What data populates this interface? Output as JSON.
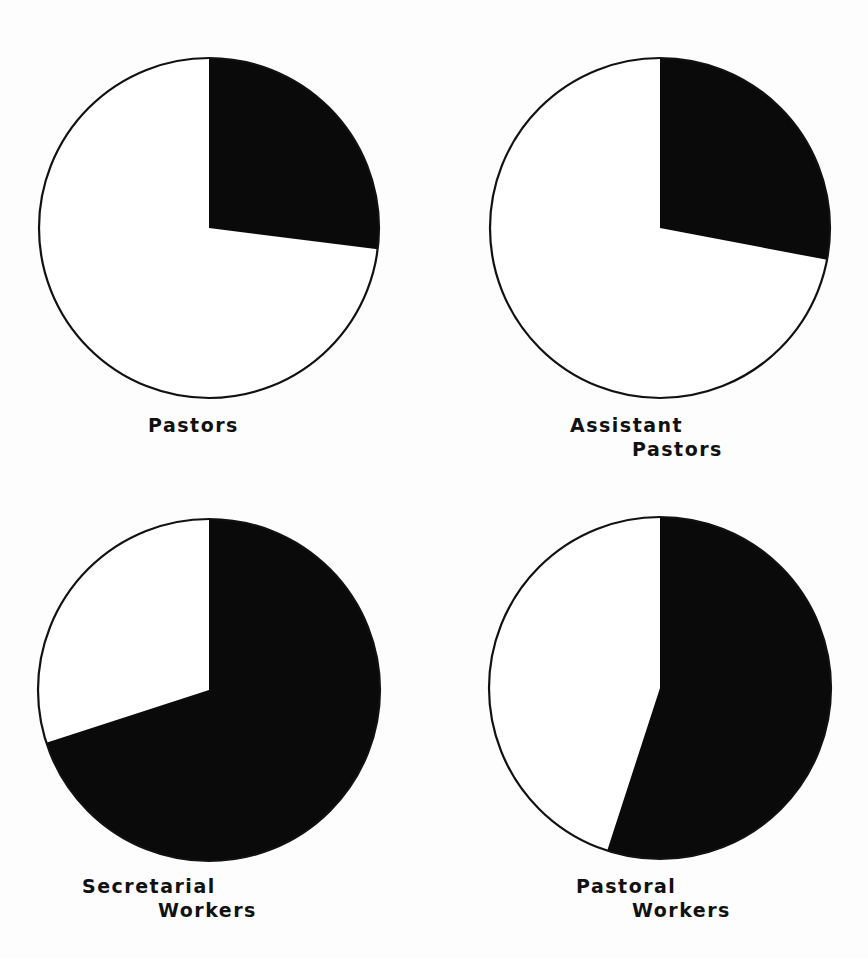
{
  "chart_data": {
    "type": "pie",
    "title": "",
    "colors": {
      "filled": "#0a0a0a",
      "unfilled": "#ffffff",
      "outline": "#111111"
    },
    "charts": [
      {
        "label_lines": [
          "Pastors"
        ],
        "slices": [
          {
            "name": "filled",
            "value": 27
          },
          {
            "name": "unfilled",
            "value": 73
          }
        ],
        "center": [
          209,
          228
        ],
        "radius": 170,
        "label_pos": [
          148,
          413
        ],
        "label_indent": [
          0
        ]
      },
      {
        "label_lines": [
          "Assistant",
          "Pastors"
        ],
        "slices": [
          {
            "name": "filled",
            "value": 28
          },
          {
            "name": "unfilled",
            "value": 72
          }
        ],
        "center": [
          660,
          228
        ],
        "radius": 170,
        "label_pos": [
          570,
          413
        ],
        "label_indent": [
          0,
          62
        ]
      },
      {
        "label_lines": [
          "Secretarial",
          "Workers"
        ],
        "slices": [
          {
            "name": "filled",
            "value": 70
          },
          {
            "name": "unfilled",
            "value": 30
          }
        ],
        "center": [
          209,
          690
        ],
        "radius": 171,
        "label_pos": [
          82,
          874
        ],
        "label_indent": [
          0,
          76
        ]
      },
      {
        "label_lines": [
          "Pastoral",
          "Workers"
        ],
        "slices": [
          {
            "name": "filled",
            "value": 55
          },
          {
            "name": "unfilled",
            "value": 45
          }
        ],
        "center": [
          660,
          688
        ],
        "radius": 171,
        "label_pos": [
          576,
          874
        ],
        "label_indent": [
          0,
          56
        ]
      }
    ]
  }
}
